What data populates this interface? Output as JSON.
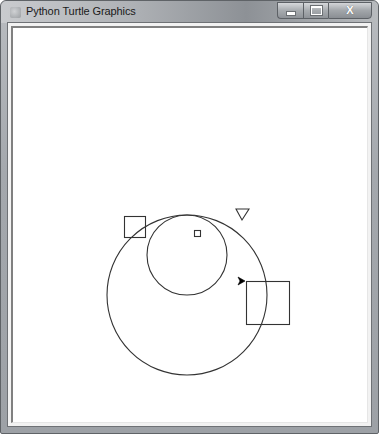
{
  "window": {
    "title": "Python Turtle Graphics",
    "caption_buttons": [
      {
        "name": "minimize",
        "icon": "minimize-icon"
      },
      {
        "name": "maximize",
        "icon": "maximize-icon",
        "glyph": "□"
      },
      {
        "name": "close",
        "icon": "close-icon",
        "glyph": "X"
      }
    ]
  },
  "canvas": {
    "background": "#ffffff",
    "stroke_color": "#333333",
    "shapes": [
      {
        "type": "circle",
        "name": "large-circle",
        "cx": 185,
        "cy": 293,
        "r": 80
      },
      {
        "type": "circle",
        "name": "small-circle",
        "cx": 185,
        "cy": 253,
        "r": 40
      },
      {
        "type": "square",
        "name": "left-square",
        "x": 122,
        "y": 214,
        "size": 21
      },
      {
        "type": "square",
        "name": "tiny-square",
        "x": 192,
        "y": 228,
        "size": 6
      },
      {
        "type": "square",
        "name": "large-square",
        "x": 244,
        "y": 279,
        "size": 43
      },
      {
        "type": "triangle",
        "name": "down-triangle",
        "points": [
          [
            234,
            207
          ],
          [
            247,
            207
          ],
          [
            240,
            218
          ]
        ]
      }
    ],
    "turtle": {
      "x": 243,
      "y": 279,
      "heading": "right",
      "color": "#000000"
    }
  }
}
